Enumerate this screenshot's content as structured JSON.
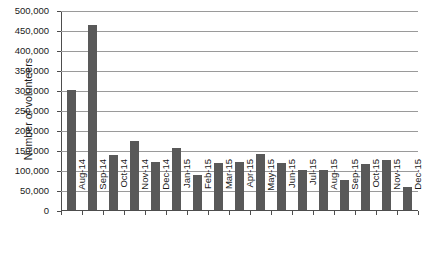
{
  "chart_data": {
    "type": "bar",
    "title": "",
    "xlabel": "",
    "ylabel": "Number of volunteers",
    "ylim": [
      0,
      500000
    ],
    "ytick_step": 50000,
    "grid": true,
    "legend": "none",
    "bar_color": "#595959",
    "gridline_color": "#9a9a9a",
    "axis_color": "#4d4d4d",
    "categories": [
      "Aug-14",
      "Sep-14",
      "Oct-14",
      "Nov-14",
      "Dec-14",
      "Jan-15",
      "Feb-15",
      "Mar-15",
      "Apr-15",
      "May-15",
      "Jun-15",
      "Jul-15",
      "Aug-15",
      "Sep-15",
      "Oct-15",
      "Nov-15",
      "Dec-15"
    ],
    "values": [
      299000,
      462000,
      137000,
      172000,
      120000,
      155000,
      88000,
      117000,
      121000,
      140000,
      118000,
      100000,
      101000,
      74000,
      114000,
      124000,
      57000
    ],
    "ytick_labels": [
      "0",
      "50,000",
      "100,000",
      "150,000",
      "200,000",
      "250,000",
      "300,000",
      "350,000",
      "400,000",
      "450,000",
      "500,000"
    ],
    "ytick_values": [
      0,
      50000,
      100000,
      150000,
      200000,
      250000,
      300000,
      350000,
      400000,
      450000,
      500000
    ]
  }
}
